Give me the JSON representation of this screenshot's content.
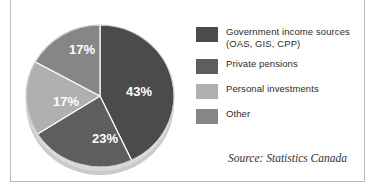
{
  "chart_data": {
    "type": "pie",
    "title": "",
    "categories": [
      "Government income sources (OAS, GIS, CPP)",
      "Private pensions",
      "Personal investments",
      "Other"
    ],
    "values": [
      43,
      23,
      17,
      17
    ],
    "data_labels": [
      "43%",
      "23%",
      "17%",
      "17%"
    ],
    "colors": [
      "#4b4b4b",
      "#5e5e5e",
      "#b0b0b0",
      "#868686"
    ],
    "legend_position": "right",
    "grid": false,
    "source": "Source: Statistics Canada"
  },
  "pie": {
    "slices": [
      {
        "label": "43%",
        "value": 43,
        "color": "#4b4b4b",
        "label_x": 117,
        "label_y": 84
      },
      {
        "label": "23%",
        "value": 23,
        "color": "#5e5e5e",
        "label_x": 83,
        "label_y": 131
      },
      {
        "label": "17%",
        "value": 17,
        "color": "#b0b0b0",
        "label_x": 44,
        "label_y": 94
      },
      {
        "label": "17%",
        "value": 17,
        "color": "#868686",
        "label_x": 60,
        "label_y": 42
      }
    ]
  },
  "legend": {
    "items": [
      {
        "color": "#4b4b4b",
        "line1": "Government income sources",
        "line2": "(OAS, GIS, CPP)"
      },
      {
        "color": "#5e5e5e",
        "line1": "Private pensions",
        "line2": ""
      },
      {
        "color": "#b0b0b0",
        "line1": "Personal investments",
        "line2": ""
      },
      {
        "color": "#868686",
        "line1": "Other",
        "line2": ""
      }
    ]
  },
  "source": {
    "text": "Source: Statistics Canada"
  }
}
